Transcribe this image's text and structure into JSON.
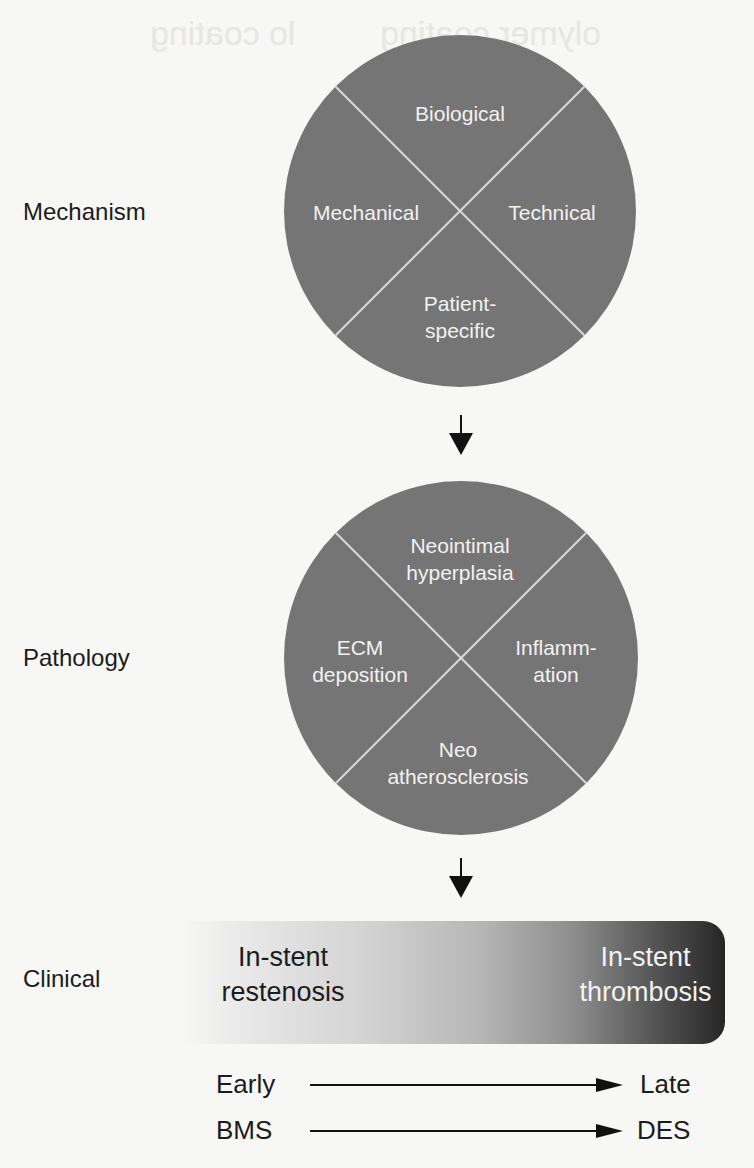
{
  "background_bleed": {
    "line1_left": "lo coating",
    "line1_right": "olymer coating"
  },
  "rows": {
    "mechanism": {
      "label": "Mechanism"
    },
    "pathology": {
      "label": "Pathology"
    },
    "clinical": {
      "label": "Clinical"
    }
  },
  "mechanism_circle": {
    "fill": "#757575",
    "divider_color": "#d9d9d9",
    "segments": {
      "top": "Biological",
      "left": "Mechanical",
      "right": "Technical",
      "bottom_line1": "Patient-",
      "bottom_line2": "specific"
    }
  },
  "pathology_circle": {
    "fill": "#757575",
    "divider_color": "#d9d9d9",
    "segments": {
      "top_line1": "Neointimal",
      "top_line2": "hyperplasia",
      "left_line1": "ECM",
      "left_line2": "deposition",
      "right_line1": "Inflamm-",
      "right_line2": "ation",
      "bottom_line1": "Neo",
      "bottom_line2": "atherosclerosis"
    }
  },
  "clinical_bar": {
    "gradient_start": "#f7f7f5",
    "gradient_end": "#262626",
    "left_line1": "In-stent",
    "left_line2": "restenosis",
    "right_line1": "In-stent",
    "right_line2": "thrombosis"
  },
  "timelines": [
    {
      "from": "Early",
      "to": "Late"
    },
    {
      "from": "BMS",
      "to": "DES"
    }
  ]
}
